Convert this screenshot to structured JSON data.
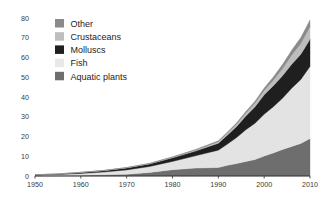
{
  "chart_data": {
    "type": "area",
    "stacked": true,
    "title": "",
    "subtitle": "",
    "xlabel": "",
    "ylabel": "",
    "xlim": [
      1950,
      2010
    ],
    "ylim": [
      0,
      80
    ],
    "grid": false,
    "legend_position": "top-left",
    "x_ticks": [
      "1950",
      "1960",
      "1970",
      "1980",
      "1990",
      "2000",
      "2010"
    ],
    "y_ticks": [
      "0",
      "10",
      "20",
      "30",
      "40",
      "50",
      "60",
      "70",
      "80"
    ],
    "x": [
      1950,
      1955,
      1960,
      1965,
      1970,
      1975,
      1980,
      1985,
      1990,
      1992,
      1994,
      1996,
      1998,
      2000,
      2002,
      2004,
      2006,
      2008,
      2010
    ],
    "series": [
      {
        "name": "Aquatic plants",
        "color": "#6e6e6e",
        "values": [
          0.1,
          0.2,
          0.4,
          0.6,
          0.9,
          1.8,
          3.2,
          4.0,
          4.3,
          5.4,
          6.3,
          7.4,
          8.3,
          10.1,
          11.7,
          13.4,
          15.0,
          16.5,
          19.0
        ]
      },
      {
        "name": "Fish",
        "color": "#e3e3e3",
        "values": [
          0.3,
          0.5,
          0.9,
          1.4,
          2.2,
          3.0,
          4.2,
          6.2,
          8.8,
          10.8,
          13.2,
          16.0,
          18.4,
          21.2,
          23.4,
          26.0,
          29.4,
          32.4,
          36.5
        ]
      },
      {
        "name": "Molluscs",
        "color": "#1f1f1f",
        "values": [
          0.2,
          0.3,
          0.5,
          0.7,
          1.0,
          1.3,
          1.8,
          2.4,
          3.5,
          4.6,
          5.6,
          7.0,
          8.4,
          9.8,
          10.6,
          11.4,
          12.2,
          12.8,
          13.8
        ]
      },
      {
        "name": "Crustaceans",
        "color": "#bdbdbd",
        "values": [
          0.02,
          0.03,
          0.05,
          0.08,
          0.12,
          0.2,
          0.3,
          0.5,
          0.8,
          1.0,
          1.2,
          1.5,
          1.8,
          2.2,
          2.8,
          3.6,
          4.6,
          5.4,
          6.3
        ]
      },
      {
        "name": "Other",
        "color": "#8a8a8a",
        "values": [
          0.02,
          0.03,
          0.05,
          0.07,
          0.1,
          0.15,
          0.2,
          0.3,
          0.4,
          0.5,
          0.6,
          0.8,
          1.0,
          1.2,
          1.6,
          2.0,
          2.5,
          3.0,
          3.4
        ]
      }
    ],
    "totals": [
      0.64,
      1.06,
      1.9,
      2.85,
      4.32,
      6.45,
      9.7,
      13.4,
      17.8,
      22.3,
      26.9,
      32.7,
      37.9,
      44.5,
      50.1,
      56.4,
      63.7,
      70.1,
      79.0
    ]
  },
  "legend": {
    "items": [
      {
        "label": "Other",
        "color": "#8a8a8a"
      },
      {
        "label": "Crustaceans",
        "color": "#bdbdbd"
      },
      {
        "label": "Molluscs",
        "color": "#1f1f1f"
      },
      {
        "label": "Fish",
        "color": "#e8e8e8"
      },
      {
        "label": "Aquatic plants",
        "color": "#6e6e6e"
      }
    ]
  },
  "axes": {
    "axis_color": "#2b2b2b"
  }
}
